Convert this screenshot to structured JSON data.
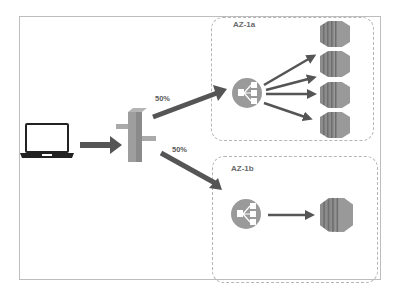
{
  "diagram": {
    "type": "aws-load-balancing-architecture",
    "nodes": {
      "client": {
        "icon": "laptop-icon"
      },
      "gateway": {
        "icon": "router-gateway-icon"
      },
      "lb_a": {
        "icon": "load-balancer-icon",
        "zone": "AZ-1a"
      },
      "lb_b": {
        "icon": "load-balancer-icon",
        "zone": "AZ-1b"
      },
      "instances_a": {
        "icon": "ec2-instance-icon",
        "count": 4
      },
      "instances_b": {
        "icon": "ec2-instance-icon",
        "count": 1
      }
    },
    "zones": [
      {
        "label": "AZ-1a"
      },
      {
        "label": "AZ-1b"
      }
    ],
    "edges": [
      {
        "from": "client",
        "to": "gateway",
        "label": ""
      },
      {
        "from": "gateway",
        "to": "lb_a",
        "label": "50%"
      },
      {
        "from": "gateway",
        "to": "lb_b",
        "label": "50%"
      },
      {
        "from": "lb_a",
        "to": "instances_a",
        "label": ""
      },
      {
        "from": "lb_b",
        "to": "instances_b",
        "label": ""
      }
    ],
    "colors": {
      "arrow": "#555555",
      "lb_circle": "#9a9a9a",
      "instance": "#8c8c8c",
      "instance_dark": "#6f6f6f",
      "gateway": "#a0a0a0",
      "zone_border": "#b5b5b5"
    }
  }
}
